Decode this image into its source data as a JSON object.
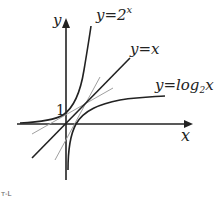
{
  "diagram": {
    "axes": {
      "x_label": "x",
      "y_label": "y"
    },
    "origin_tick_label": "1",
    "curves": [
      {
        "name": "exponential",
        "label_main": "y=2",
        "label_sup": "x",
        "color": "#222222"
      },
      {
        "name": "identity",
        "label_main": "y=x",
        "color": "#222222"
      },
      {
        "name": "logarithm",
        "label_main": "y=log",
        "label_sub": "2",
        "label_tail": "x",
        "color": "#222222"
      }
    ],
    "tangent_lines_color": "#999999",
    "corner_mark": "т‑L"
  }
}
